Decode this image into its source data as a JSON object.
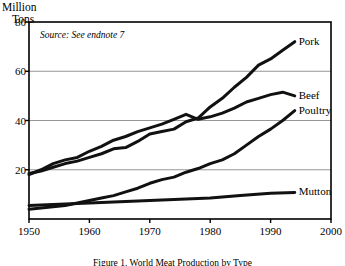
{
  "chart_data": {
    "type": "line",
    "title": "",
    "ylabel": "Million\nTons",
    "ylabel_lines": [
      "Million",
      "Tons"
    ],
    "xlabel": "",
    "xlim": [
      1950,
      2000
    ],
    "ylim": [
      0,
      80
    ],
    "yticks": [
      0,
      20,
      40,
      60,
      80
    ],
    "ytick_labels": [
      "",
      "20",
      "40",
      "60",
      "80"
    ],
    "xticks": [
      1950,
      1960,
      1970,
      1980,
      1990,
      2000
    ],
    "xtick_labels": [
      "1950",
      "1960",
      "1970",
      "1980",
      "1990",
      "2000"
    ],
    "grid": true,
    "grid_axis": "y",
    "legend_position": "right-inline",
    "annotations": [
      {
        "text": "Source: See endnote 7",
        "x": 1953,
        "y": 74,
        "style": "italic"
      }
    ],
    "series": [
      {
        "name": "Pork",
        "label": "Pork",
        "color": "#111111",
        "x": [
          1950,
          1952,
          1954,
          1956,
          1958,
          1960,
          1962,
          1964,
          1966,
          1968,
          1970,
          1972,
          1974,
          1976,
          1978,
          1980,
          1982,
          1984,
          1986,
          1988,
          1990,
          1992,
          1994
        ],
        "values": [
          18.5,
          19.5,
          21.0,
          22.5,
          23.5,
          25.0,
          26.5,
          28.5,
          29.0,
          31.5,
          34.5,
          35.5,
          36.5,
          39.5,
          41.0,
          45.5,
          49.0,
          53.5,
          57.5,
          62.5,
          65.0,
          68.5,
          72.0
        ]
      },
      {
        "name": "Beef",
        "label": "Beef",
        "color": "#111111",
        "x": [
          1950,
          1952,
          1954,
          1956,
          1958,
          1960,
          1962,
          1964,
          1966,
          1968,
          1970,
          1972,
          1974,
          1976,
          1978,
          1980,
          1982,
          1984,
          1986,
          1988,
          1990,
          1992,
          1994
        ],
        "values": [
          18.0,
          20.0,
          22.5,
          24.0,
          25.0,
          27.5,
          29.5,
          32.0,
          33.5,
          35.5,
          37.0,
          38.5,
          40.5,
          42.5,
          40.5,
          41.5,
          43.0,
          45.0,
          47.5,
          49.0,
          50.5,
          51.5,
          50.0
        ]
      },
      {
        "name": "Poultry",
        "label": "Poultry",
        "color": "#111111",
        "x": [
          1950,
          1952,
          1954,
          1956,
          1958,
          1960,
          1962,
          1964,
          1966,
          1968,
          1970,
          1972,
          1974,
          1976,
          1978,
          1980,
          1982,
          1984,
          1986,
          1988,
          1990,
          1992,
          1994
        ],
        "values": [
          4.0,
          4.5,
          5.0,
          5.5,
          6.5,
          7.5,
          8.5,
          9.5,
          11.0,
          12.5,
          14.5,
          16.0,
          17.0,
          19.0,
          20.5,
          22.5,
          24.0,
          26.5,
          30.0,
          33.5,
          36.5,
          40.0,
          44.0
        ]
      },
      {
        "name": "Mutton",
        "label": "Mutton",
        "color": "#111111",
        "x": [
          1950,
          1955,
          1960,
          1965,
          1970,
          1975,
          1980,
          1985,
          1990,
          1994
        ],
        "values": [
          5.5,
          6.0,
          6.5,
          7.0,
          7.5,
          8.0,
          8.5,
          9.5,
          10.5,
          10.8
        ]
      }
    ]
  },
  "caption": {
    "text": "Figure 1. World Meat Production by Type"
  },
  "colors": {
    "frame": "#000000",
    "grid": "#8a8a8a",
    "line": "#111111",
    "background": "#ffffff"
  }
}
